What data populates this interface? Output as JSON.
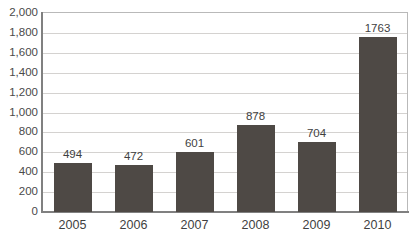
{
  "chart_data": {
    "type": "bar",
    "title": "",
    "subtitle": "",
    "xlabel": "",
    "ylabel": "",
    "categories": [
      "2005",
      "2006",
      "2007",
      "2008",
      "2009",
      "2010"
    ],
    "values": [
      494,
      472,
      601,
      878,
      704,
      1763
    ],
    "data_labels": [
      "494",
      "472",
      "601",
      "878",
      "704",
      "1763"
    ],
    "ylim": [
      0,
      2000
    ],
    "ytick_step": 200,
    "ytick_labels": [
      "2,000",
      "1,800",
      "1,600",
      "1,400",
      "1,200",
      "1,000",
      "800",
      "600",
      "400",
      "200",
      "0"
    ],
    "ytick_values": [
      2000,
      1800,
      1600,
      1400,
      1200,
      1000,
      800,
      600,
      400,
      200,
      0
    ],
    "grid": true,
    "grid_orientation": "horizontal",
    "legend": false,
    "legend_position": "none",
    "series": [
      {
        "name": "",
        "values": [
          494,
          472,
          601,
          878,
          704,
          1763
        ]
      }
    ],
    "colors": {
      "bar": "#4e4945",
      "gridline": "#d4d2d0",
      "axis": "#808080",
      "text": "#3f3f3f",
      "background": "#ffffff"
    }
  }
}
